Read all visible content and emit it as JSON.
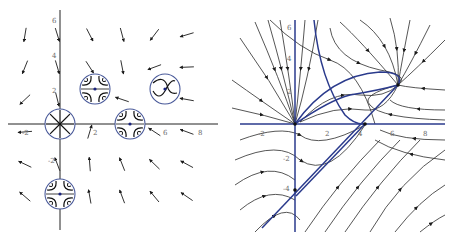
{
  "figure": {
    "panels": [
      {
        "id": "left",
        "kind": "direction-field",
        "axes": {
          "x_ticks": [
            "-2",
            "2",
            "6",
            "8"
          ],
          "y_ticks": [
            "6",
            "4",
            "2",
            "-2"
          ],
          "x_range": [
            -3,
            9
          ],
          "y_range": [
            -6,
            6.5
          ]
        },
        "equilibria": [
          {
            "x": 0,
            "y": 0,
            "type": "unstable-node"
          },
          {
            "x": 2,
            "y": 2,
            "type": "saddle"
          },
          {
            "x": 4,
            "y": 0,
            "type": "saddle"
          },
          {
            "x": 6,
            "y": 2,
            "type": "stable-node"
          },
          {
            "x": 0,
            "y": -4,
            "type": "saddle"
          }
        ]
      },
      {
        "id": "right",
        "kind": "phase-portrait-streamlines",
        "axes": {
          "x_ticks": [
            "-2",
            "2",
            "4",
            "6",
            "8"
          ],
          "y_ticks": [
            "6",
            "4",
            "2",
            "-2",
            "-4"
          ],
          "x_range": [
            -3,
            9
          ],
          "y_range": [
            -6,
            6.5
          ]
        },
        "separatrix_color": "#2a3a8c"
      }
    ],
    "colors": {
      "axis": "#222222",
      "arrow": "#1a1a1a",
      "circle": "#4a5a9a",
      "streamline": "#2b2b2b",
      "separatrix": "#2a3a8c",
      "tick_label": "#6a6a6a"
    }
  }
}
